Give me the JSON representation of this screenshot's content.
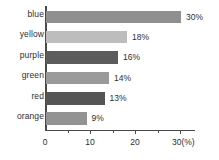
{
  "chart_data": {
    "type": "bar",
    "orientation": "horizontal",
    "title": "",
    "xlabel": "(%)",
    "ylabel": "",
    "categories": [
      "blue",
      "yellow",
      "purple",
      "green",
      "red",
      "orange"
    ],
    "values": [
      30,
      18,
      16,
      14,
      13,
      9
    ],
    "value_labels": [
      "30%",
      "18%",
      "16%",
      "14%",
      "13%",
      "9%"
    ],
    "bar_colors": [
      "#8f8f8f",
      "#bdbdbd",
      "#5c5c5c",
      "#9a9a9a",
      "#555555",
      "#939393"
    ],
    "xlim": [
      0,
      33
    ],
    "xticks": [
      0,
      10,
      20,
      30
    ],
    "xtick_labels": [
      "0",
      "10",
      "20",
      "30(%)"
    ],
    "minor_xticks": [
      5,
      15,
      25
    ],
    "grid": false,
    "legend": false
  },
  "axis": {
    "line_color": "#4a4a4a",
    "text_color": "#2e2e2e"
  }
}
